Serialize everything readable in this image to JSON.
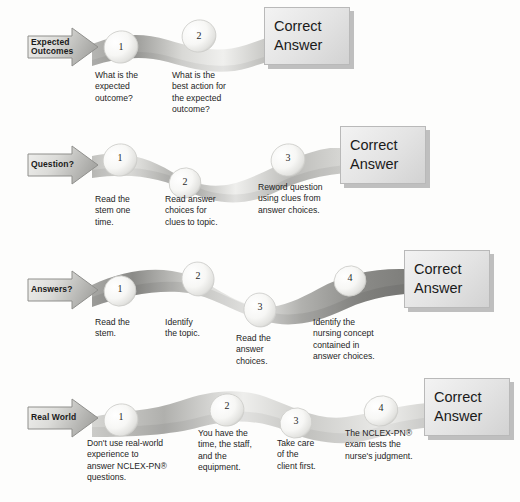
{
  "colors": {
    "page_background": "#fdfdfc",
    "ribbon_light": "#f2f2f0",
    "ribbon_mid": "#c9c9c6",
    "ribbon_dark": "#8e8e8b",
    "bubble_fill": "#fafafa",
    "bubble_edge": "#cfcfcc",
    "box_fill": "#e9e9e9",
    "box_border": "#b9b9b9",
    "box_shadow": "#8c8c8c",
    "text": "#1e1e1e"
  },
  "answer_box_label": {
    "line1": "Correct",
    "line2": "Answer"
  },
  "rows": [
    {
      "name": "expected-outcomes",
      "arrow_label": "Expected\nOutcomes",
      "steps": [
        {
          "number": "1",
          "caption": "What is the\nexpected\noutcome?"
        },
        {
          "number": "2",
          "caption": "What is the\nbest action for\nthe expected\noutcome?"
        }
      ]
    },
    {
      "name": "question",
      "arrow_label": "Question?",
      "steps": [
        {
          "number": "1",
          "caption": "Read the\nstem one\ntime."
        },
        {
          "number": "2",
          "caption": "Read answer\nchoices for\nclues to topic."
        },
        {
          "number": "3",
          "caption": "Reword question\nusing clues from\nanswer choices."
        }
      ]
    },
    {
      "name": "answers",
      "arrow_label": "Answers?",
      "steps": [
        {
          "number": "1",
          "caption": "Read the\nstem."
        },
        {
          "number": "2",
          "caption": "Identify\nthe topic."
        },
        {
          "number": "3",
          "caption": "Read the\nanswer\nchoices."
        },
        {
          "number": "4",
          "caption": "Identify the\nnursing concept\ncontained in\nanswer choices."
        }
      ]
    },
    {
      "name": "real-world",
      "arrow_label": "Real World",
      "steps": [
        {
          "number": "1",
          "caption": "Don't use real-world\nexperience to\nanswer NCLEX-PN®\nquestions."
        },
        {
          "number": "2",
          "caption": "You have the\ntime, the staff,\nand the\nequipment."
        },
        {
          "number": "3",
          "caption": "Take care\nof the\nclient first."
        },
        {
          "number": "4",
          "caption": "The NCLEX-PN®\nexam tests the\nnurse's judgment."
        }
      ]
    }
  ]
}
